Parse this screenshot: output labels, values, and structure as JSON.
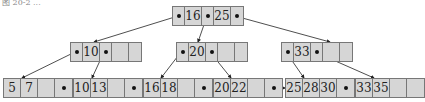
{
  "caption": "图  20-2 ...",
  "colors": {
    "node_fill": "#d6d6d6",
    "node_border": "#777777",
    "edge": "#222222"
  },
  "root": {
    "keys": [
      "16",
      "25"
    ]
  },
  "internal": [
    {
      "keys": [
        "10",
        ""
      ]
    },
    {
      "keys": [
        "20",
        ""
      ]
    },
    {
      "keys": [
        "33",
        ""
      ]
    }
  ],
  "leaves": [
    {
      "keys": [
        "5",
        "7",
        ""
      ]
    },
    {
      "keys": [
        "10",
        "13",
        ""
      ]
    },
    {
      "keys": [
        "16",
        "18",
        ""
      ]
    },
    {
      "keys": [
        "20",
        "22",
        ""
      ]
    },
    {
      "keys": [
        "25",
        "28",
        "30"
      ]
    },
    {
      "keys": [
        "33",
        "35",
        ""
      ]
    }
  ]
}
